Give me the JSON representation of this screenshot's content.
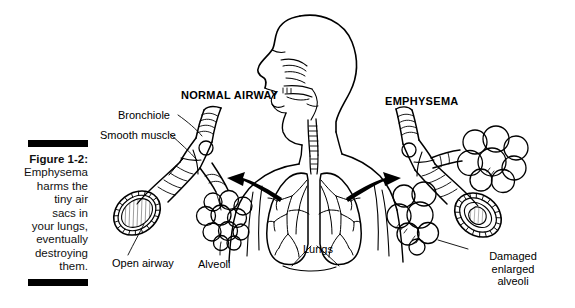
{
  "figure": {
    "number": "Figure 1-2:",
    "caption_lines": [
      "Emphysema",
      "harms the",
      "tiny air",
      "sacs in",
      "your lungs,",
      "eventually",
      "destroying",
      "them."
    ],
    "caption_full": "Figure 1-2: Emphysema harms the tiny air sacs in your lungs, eventually destroying them."
  },
  "headings": {
    "left": "NORMAL AIRWAY",
    "right": "EMPHYSEMA"
  },
  "labels": {
    "bronchiole": "Bronchiole",
    "smooth_muscle": "Smooth muscle",
    "open_airway": "Open airway",
    "alveoli": "Alveoli",
    "lungs": "Lungs",
    "damaged_line1": "Damaged",
    "damaged_line2": "enlarged",
    "damaged_line3": "alveoli"
  },
  "colors": {
    "ink": "#000000",
    "background": "#ffffff",
    "shading": "#b9b9b9",
    "light_shading": "#dcdcdc"
  },
  "illustration": {
    "subject": "human head and torso in profile with lungs, flanked by two airway callout details",
    "left_detail": "normal bronchiole with smooth muscle bands, open airway cross-section and alveoli cluster",
    "right_detail": "emphysema bronchiole with narrowed airway cross-section and damaged enlarged alveoli",
    "arrows": 2
  }
}
